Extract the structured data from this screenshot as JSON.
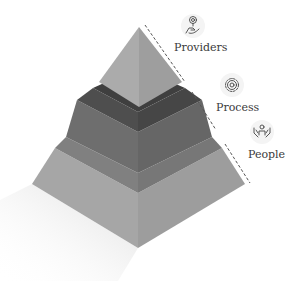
{
  "diagram": {
    "type": "isometric-pyramid",
    "tiers": [
      {
        "label": "Providers",
        "icon": "hand-coin-icon",
        "level": "top"
      },
      {
        "label": "Process",
        "icon": "gear-icon",
        "level": "middle"
      },
      {
        "label": "People",
        "icon": "people-hands-icon",
        "level": "bottom"
      }
    ],
    "colors": {
      "top_left": "#a9a9a9",
      "top_right": "#9c9c9c",
      "middle_band_left": "#4e4e4e",
      "middle_band_right": "#454545",
      "middle_left": "#6e6e6e",
      "middle_right": "#666666",
      "bottom_band_left": "#7f7f7f",
      "bottom_band_right": "#767676",
      "bottom_left": "#a6a6a6",
      "bottom_right": "#9d9d9d",
      "dash": "#555555",
      "shadow": "#e6e6e6"
    }
  }
}
